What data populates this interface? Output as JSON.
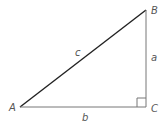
{
  "diagram": {
    "vertices": {
      "A": {
        "label": "A",
        "x": 20,
        "y": 107
      },
      "B": {
        "label": "B",
        "x": 146,
        "y": 10
      },
      "C": {
        "label": "C",
        "x": 146,
        "y": 107
      }
    },
    "sides": {
      "a": {
        "label": "a",
        "from": "B",
        "to": "C"
      },
      "b": {
        "label": "b",
        "from": "A",
        "to": "C"
      },
      "c": {
        "label": "c",
        "from": "A",
        "to": "B"
      }
    },
    "right_angle_at": "C",
    "colors": {
      "hypotenuse": "#222222",
      "legs": "#777777",
      "labels": "#555555"
    }
  }
}
